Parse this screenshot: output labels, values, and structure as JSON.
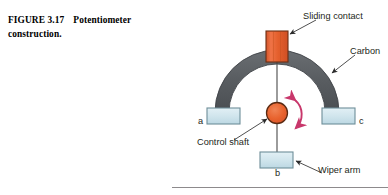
{
  "caption": {
    "figure_number": "FIGURE 3.17",
    "title_line1": "Potentiometer",
    "title_line2": "construction."
  },
  "figure": {
    "labels": {
      "sliding_contact": "Sliding contact",
      "carbon": "Carbon",
      "control_shaft": "Control shaft",
      "wiper_arm": "Wiper arm"
    },
    "terminals": {
      "left": "a",
      "right": "c",
      "bottom": "b"
    },
    "colors": {
      "carbon_arc": "#5b5f63",
      "carbon_arc_edge": "#3f4347",
      "slider_fill": "#e8622d",
      "slider_edge": "#6b2f14",
      "shaft_fill": "#e8622d",
      "shaft_edge": "#5a2a12",
      "terminal_fill": "#cfe4ec",
      "terminal_edge": "#6e8e99",
      "rotation_arrow": "#c8376b",
      "leader_line": "#3b3b3b",
      "text": "#231f20",
      "rule": "#8d8a8c"
    },
    "rotation_arrow_name": "bidirectional-rotation-arrow"
  }
}
